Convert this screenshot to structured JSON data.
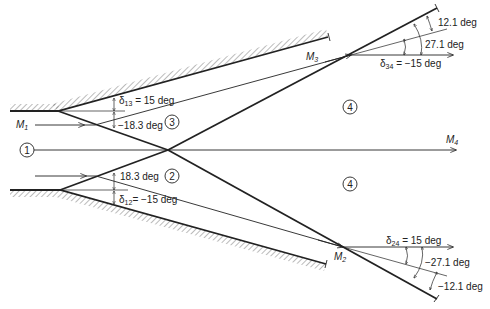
{
  "diagram": {
    "type": "shock-wave intersection",
    "regions": [
      {
        "id": "1",
        "label": "1"
      },
      {
        "id": "2",
        "label": "2"
      },
      {
        "id": "3",
        "label": "3"
      },
      {
        "id": "4a",
        "label": "4"
      },
      {
        "id": "4b",
        "label": "4"
      }
    ],
    "mach_labels": {
      "m1": {
        "base": "M",
        "sub": "1"
      },
      "m2": {
        "base": "M",
        "sub": "2"
      },
      "m3": {
        "base": "M",
        "sub": "3"
      },
      "m4": {
        "base": "M",
        "sub": "4"
      }
    },
    "angles": {
      "d13": {
        "base": "δ",
        "sub": "13",
        "value": " = 15 deg"
      },
      "d13_shock": {
        "value": "−18.3 deg"
      },
      "d12_shock": {
        "value": "18.3 deg"
      },
      "d12": {
        "base": "δ",
        "sub": "12",
        "value": "= −15 deg"
      },
      "d34": {
        "base": "δ",
        "sub": "34",
        "value": " = −15 deg"
      },
      "d34_a": {
        "value": "12.1 deg"
      },
      "d34_b": {
        "value": "27.1 deg"
      },
      "d24": {
        "base": "δ",
        "sub": "24",
        "value": " = 15 deg"
      },
      "d24_a": {
        "value": "−27.1 deg"
      },
      "d24_b": {
        "value": "−12.1 deg"
      }
    }
  }
}
